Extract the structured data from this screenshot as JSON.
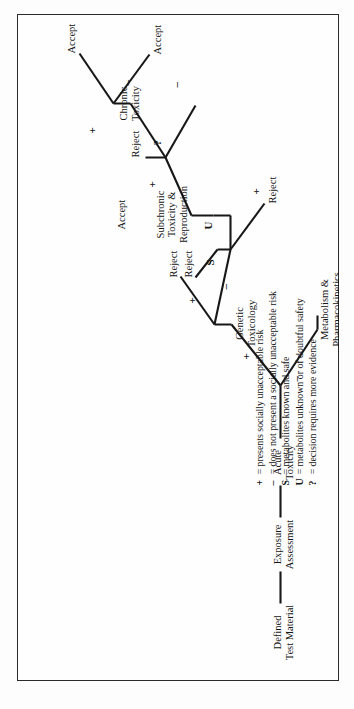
{
  "figure": {
    "caption": "Figure 11.1"
  },
  "diagram": {
    "type": "decision-tree",
    "orientation": "rotated-90-ccw",
    "nodes": [
      {
        "id": "defined-test-material",
        "label_lines": [
          "Defined",
          "Test Material"
        ]
      },
      {
        "id": "exposure-assessment",
        "label_lines": [
          "Exposure",
          "Assessment"
        ]
      },
      {
        "id": "acute-toxicity",
        "label_lines": [
          "Acute",
          "Toxicity"
        ]
      },
      {
        "id": "genetic-toxicology",
        "label_lines": [
          "Genetic",
          "Toxicology"
        ]
      },
      {
        "id": "metabolism-pharmacokinetics",
        "label_lines": [
          "Metabolism &",
          "Pharmacokinetics"
        ]
      },
      {
        "id": "subchronic-toxicity-reproduction",
        "label_lines": [
          "Subchronic",
          "Toxicity &",
          "Reproduction"
        ]
      },
      {
        "id": "chronic-toxicity",
        "label_lines": [
          "Chronic",
          "Toxicity"
        ]
      }
    ],
    "outcomes": [
      {
        "id": "reject-acute",
        "label": "Reject"
      },
      {
        "id": "reject-genetic",
        "label": "Reject"
      },
      {
        "id": "accept-metabolism",
        "label": "Accept"
      },
      {
        "id": "reject-subchronic",
        "label": "Reject"
      },
      {
        "id": "reject-chronic",
        "label": "Reject"
      },
      {
        "id": "accept-chronic",
        "label": "Accept"
      },
      {
        "id": "accept-subchronic",
        "label": "Accept"
      }
    ],
    "edge_symbols": {
      "acute_plus": "+",
      "acute_minus": "–",
      "genetic_plus": "+",
      "genetic_minus": "–",
      "metabolism_s": "S",
      "metabolism_u": "U",
      "subchronic_plus": "+",
      "subchronic_minus": "–",
      "chronic_query": "?",
      "chronic_plus": "+",
      "chronic_minus": "–"
    }
  },
  "legend": {
    "equals": "=",
    "rows": [
      {
        "symbol": "+",
        "text": "presents socially unacceptable risk"
      },
      {
        "symbol": "–",
        "text": "does not present a socially unacceptable risk"
      },
      {
        "symbol": "S",
        "text": "metabolites known and safe"
      },
      {
        "symbol": "U",
        "text": "metabolites unknown or of doubtful safety"
      },
      {
        "symbol": "?",
        "text": "decision requires more evidence"
      }
    ]
  }
}
